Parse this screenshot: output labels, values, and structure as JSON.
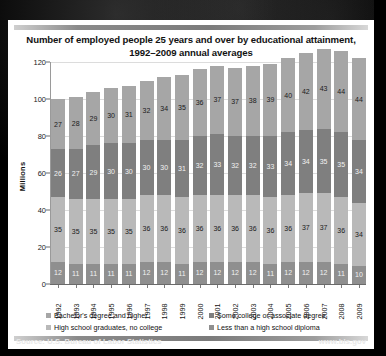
{
  "chart_data": {
    "type": "bar",
    "subtype": "stacked-bar",
    "title": "Number of employed people 25 years and over by educational attainment, 1992–2009 annual averages",
    "title_line1": "Number of employed people 25 years and over by educational attainment,",
    "title_line2": "1992–2009 annual averages",
    "xlabel": "",
    "ylabel": "Millions",
    "ylim": [
      0,
      120
    ],
    "yticks": [
      0,
      20,
      40,
      60,
      80,
      100,
      120
    ],
    "grid": true,
    "legend_position": "bottom",
    "categories": [
      "1992",
      "1993",
      "1994",
      "1995",
      "1996",
      "1997",
      "1998",
      "1999",
      "2000",
      "2001",
      "2002",
      "2003",
      "2004",
      "2005",
      "2006",
      "2007",
      "2008",
      "2009"
    ],
    "stack_order_top_to_bottom": [
      "Bachelor's degree and higher",
      "Some college or associate degree",
      "High school graduates, no college",
      "Less than a high school diploma"
    ],
    "series": [
      {
        "name": "Less than a high school diploma",
        "color": "#8f8f8f",
        "values": [
          12,
          11,
          11,
          11,
          11,
          12,
          12,
          11,
          12,
          12,
          12,
          12,
          11,
          12,
          12,
          12,
          11,
          10
        ]
      },
      {
        "name": "High school graduates, no college",
        "color": "#b9b9b9",
        "values": [
          35,
          35,
          35,
          35,
          35,
          36,
          36,
          36,
          36,
          36,
          36,
          36,
          36,
          36,
          37,
          37,
          36,
          34
        ]
      },
      {
        "name": "Some college or associate degree",
        "color": "#7f7f7f",
        "values": [
          26,
          27,
          29,
          30,
          30,
          30,
          30,
          31,
          32,
          33,
          32,
          32,
          33,
          34,
          34,
          35,
          35,
          34
        ]
      },
      {
        "name": "Bachelor's degree and higher",
        "color": "#a6a6a6",
        "values": [
          27,
          28,
          29,
          30,
          31,
          32,
          34,
          35,
          36,
          37,
          37,
          38,
          39,
          40,
          42,
          43,
          44,
          44
        ]
      }
    ]
  },
  "legend": {
    "items": [
      {
        "label": "Bachelor's degree and higher",
        "color": "#a6a6a6"
      },
      {
        "label": "Some college or associate degree",
        "color": "#7f7f7f"
      },
      {
        "label": "High school graduates, no college",
        "color": "#b9b9b9"
      },
      {
        "label": "Less than a high school diploma",
        "color": "#8f8f8f"
      }
    ]
  },
  "footer": {
    "source": "Source: U.S. Bureau of Labor Statistics",
    "website": "www.bls.gov"
  }
}
